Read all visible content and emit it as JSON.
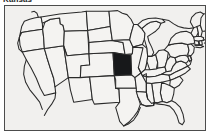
{
  "page": {
    "title": "Kansas",
    "background_color": "#ffffff"
  },
  "map": {
    "name": "united-states-locator-map",
    "frame_border_color": "#4c4c4c",
    "ocean_background_color": "#f1f0ee",
    "state_fill_color": "#f4f3f1",
    "state_border_color": "#2a2a2a",
    "highlight_fill_color": "#17181a",
    "highlighted_state": "Kansas",
    "projection_note": "contiguous United States, 48 states outlined",
    "states": [
      {
        "code": "WA",
        "name": "Washington",
        "highlighted": false
      },
      {
        "code": "OR",
        "name": "Oregon",
        "highlighted": false
      },
      {
        "code": "CA",
        "name": "California",
        "highlighted": false
      },
      {
        "code": "NV",
        "name": "Nevada",
        "highlighted": false
      },
      {
        "code": "ID",
        "name": "Idaho",
        "highlighted": false
      },
      {
        "code": "MT",
        "name": "Montana",
        "highlighted": false
      },
      {
        "code": "WY",
        "name": "Wyoming",
        "highlighted": false
      },
      {
        "code": "UT",
        "name": "Utah",
        "highlighted": false
      },
      {
        "code": "AZ",
        "name": "Arizona",
        "highlighted": false
      },
      {
        "code": "CO",
        "name": "Colorado",
        "highlighted": false
      },
      {
        "code": "NM",
        "name": "New Mexico",
        "highlighted": false
      },
      {
        "code": "ND",
        "name": "North Dakota",
        "highlighted": false
      },
      {
        "code": "SD",
        "name": "South Dakota",
        "highlighted": false
      },
      {
        "code": "NE",
        "name": "Nebraska",
        "highlighted": false
      },
      {
        "code": "KS",
        "name": "Kansas",
        "highlighted": true
      },
      {
        "code": "OK",
        "name": "Oklahoma",
        "highlighted": false
      },
      {
        "code": "TX",
        "name": "Texas",
        "highlighted": false
      },
      {
        "code": "MN",
        "name": "Minnesota",
        "highlighted": false
      },
      {
        "code": "IA",
        "name": "Iowa",
        "highlighted": false
      },
      {
        "code": "MO",
        "name": "Missouri",
        "highlighted": false
      },
      {
        "code": "AR",
        "name": "Arkansas",
        "highlighted": false
      },
      {
        "code": "LA",
        "name": "Louisiana",
        "highlighted": false
      },
      {
        "code": "WI",
        "name": "Wisconsin",
        "highlighted": false
      },
      {
        "code": "IL",
        "name": "Illinois",
        "highlighted": false
      },
      {
        "code": "MI",
        "name": "Michigan",
        "highlighted": false
      },
      {
        "code": "IN",
        "name": "Indiana",
        "highlighted": false
      },
      {
        "code": "OH",
        "name": "Ohio",
        "highlighted": false
      },
      {
        "code": "KY",
        "name": "Kentucky",
        "highlighted": false
      },
      {
        "code": "TN",
        "name": "Tennessee",
        "highlighted": false
      },
      {
        "code": "MS",
        "name": "Mississippi",
        "highlighted": false
      },
      {
        "code": "AL",
        "name": "Alabama",
        "highlighted": false
      },
      {
        "code": "GA",
        "name": "Georgia",
        "highlighted": false
      },
      {
        "code": "FL",
        "name": "Florida",
        "highlighted": false
      },
      {
        "code": "SC",
        "name": "South Carolina",
        "highlighted": false
      },
      {
        "code": "NC",
        "name": "North Carolina",
        "highlighted": false
      },
      {
        "code": "VA",
        "name": "Virginia",
        "highlighted": false
      },
      {
        "code": "WV",
        "name": "West Virginia",
        "highlighted": false
      },
      {
        "code": "MD",
        "name": "Maryland",
        "highlighted": false
      },
      {
        "code": "DE",
        "name": "Delaware",
        "highlighted": false
      },
      {
        "code": "PA",
        "name": "Pennsylvania",
        "highlighted": false
      },
      {
        "code": "NJ",
        "name": "New Jersey",
        "highlighted": false
      },
      {
        "code": "NY",
        "name": "New York",
        "highlighted": false
      },
      {
        "code": "CT",
        "name": "Connecticut",
        "highlighted": false
      },
      {
        "code": "RI",
        "name": "Rhode Island",
        "highlighted": false
      },
      {
        "code": "MA",
        "name": "Massachusetts",
        "highlighted": false
      },
      {
        "code": "VT",
        "name": "Vermont",
        "highlighted": false
      },
      {
        "code": "NH",
        "name": "New Hampshire",
        "highlighted": false
      },
      {
        "code": "ME",
        "name": "Maine",
        "highlighted": false
      }
    ]
  }
}
